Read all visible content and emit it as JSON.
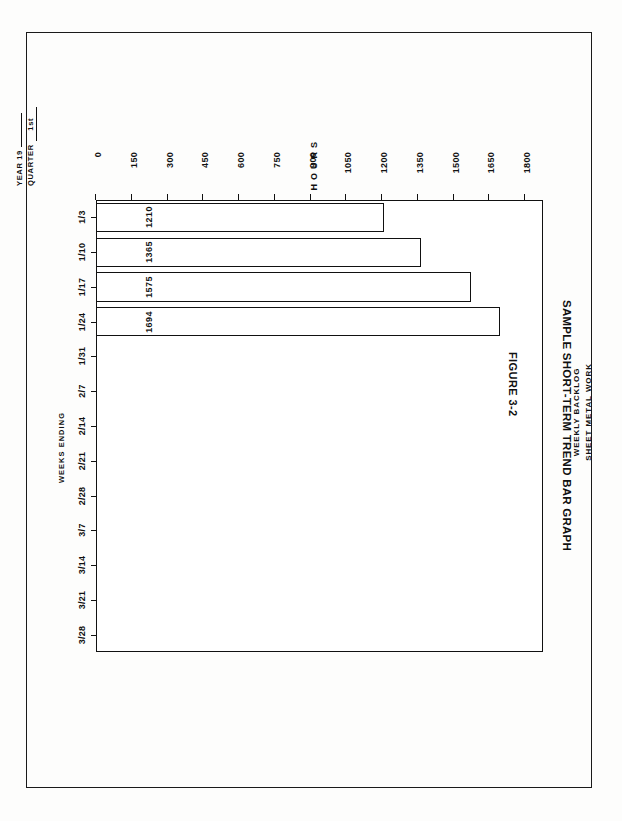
{
  "form_header": {
    "year_label": "YEAR 19",
    "year_value": "",
    "quarter_label": "QUARTER",
    "quarter_value": "1st"
  },
  "figure": {
    "number": "FIGURE 3-2",
    "caption": "SAMPLE SHORT-TERM TREND BAR GRAPH"
  },
  "chart_data": {
    "type": "bar",
    "title": "WEEKLY BACKLOG",
    "subtitle": "SHEET METAL WORK",
    "orientation": "vertical",
    "xlabel": "WEEKS ENDING",
    "ylabel": "HOURS",
    "categories": [
      "1/3",
      "1/10",
      "1/17",
      "1/24",
      "1/31",
      "2/7",
      "2/14",
      "2/21",
      "2/28",
      "3/7",
      "3/14",
      "3/21",
      "3/28"
    ],
    "values": [
      1210,
      1365,
      1575,
      1694,
      null,
      null,
      null,
      null,
      null,
      null,
      null,
      null,
      null
    ],
    "data_labels": [
      "1210",
      "1365",
      "1575",
      "1694",
      "",
      "",
      "",
      "",
      "",
      "",
      "",
      "",
      ""
    ],
    "ylim": [
      0,
      1875
    ],
    "yticks": [
      0,
      150,
      300,
      450,
      600,
      750,
      900,
      1050,
      1200,
      1350,
      1500,
      1650,
      1800
    ],
    "ytick_labels": [
      "0",
      "150",
      "300",
      "450",
      "600",
      "750",
      "900",
      "1050",
      "1200",
      "1350",
      "1500",
      "1650",
      "1800"
    ],
    "grid": false,
    "legend": null,
    "bar_fill": "#ffffff",
    "bar_edge": "#111111"
  }
}
